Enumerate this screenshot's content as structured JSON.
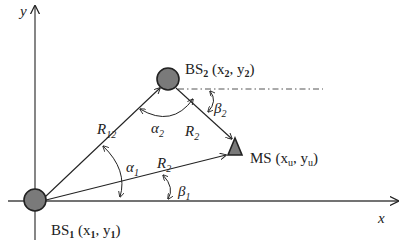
{
  "axes": {
    "x_label": "x",
    "y_label": "y"
  },
  "nodes": {
    "bs1": {
      "name": "BS",
      "sub": "1",
      "coords_open": " (x",
      "c1_sub": "1",
      "comma": ", y",
      "c2_sub": "1",
      "close": ")"
    },
    "bs2": {
      "name": "BS",
      "sub": "2",
      "coords_open": " (x",
      "c1_sub": "2",
      "comma": ", y",
      "c2_sub": "2",
      "close": ")"
    },
    "ms": {
      "name": "MS",
      "coords_open": " (x",
      "c1_sub": "u",
      "comma": ", y",
      "c2_sub": "u",
      "close": ")"
    }
  },
  "edges": {
    "r12": {
      "main": "R",
      "sub": "12"
    },
    "r2_top": {
      "main": "R",
      "sub": "2"
    },
    "r2_bottom": {
      "main": "R",
      "sub": "2"
    }
  },
  "angles": {
    "alpha1": {
      "main": "α",
      "sub": "1"
    },
    "alpha2": {
      "main": "α",
      "sub": "2"
    },
    "beta1": {
      "main": "β",
      "sub": "1"
    },
    "beta2": {
      "main": "β",
      "sub": "2"
    }
  },
  "colors": {
    "node_fill": "#7a7a7a",
    "stroke": "#222222",
    "axis": "#444444"
  }
}
